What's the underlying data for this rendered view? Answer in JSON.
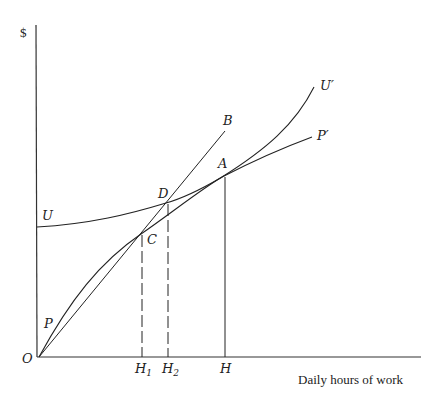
{
  "diagram": {
    "y_axis_label": "$",
    "x_axis_label": "Daily hours of work",
    "origin_label": "O",
    "curves": {
      "production": {
        "start_label": "P",
        "end_label": "P′"
      },
      "utility": {
        "start_label": "U",
        "end_label": "U′"
      },
      "ray": {
        "end_label": "B"
      }
    },
    "points": {
      "A": "A",
      "C": "C",
      "D": "D"
    },
    "x_ticks": {
      "H1": "H",
      "H1_sub": "1",
      "H2": "H",
      "H2_sub": "2",
      "H": "H"
    }
  },
  "colors": {
    "line": "#222222",
    "background": "#ffffff"
  }
}
